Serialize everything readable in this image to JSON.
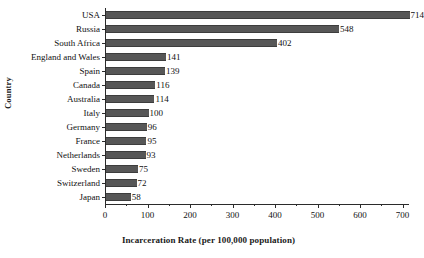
{
  "chart_data": {
    "type": "bar",
    "orientation": "horizontal",
    "title": "",
    "xlabel": "Incarceration Rate (per 100,000 population)",
    "ylabel": "Country",
    "categories": [
      "USA",
      "Russia",
      "South Africa",
      "England and Wales",
      "Spain",
      "Canada",
      "Australia",
      "Italy",
      "Germany",
      "France",
      "Netherlands",
      "Sweden",
      "Switzerland",
      "Japan"
    ],
    "values": [
      714,
      548,
      402,
      141,
      139,
      116,
      114,
      100,
      96,
      95,
      93,
      75,
      72,
      58
    ],
    "xlim": [
      0,
      715
    ],
    "xticks": [
      0,
      100,
      200,
      300,
      400,
      500,
      600,
      700
    ],
    "xtick_labels": [
      "0",
      "100",
      "200",
      "300",
      "400",
      "500",
      "600",
      "700"
    ],
    "minor_xticks": [
      50,
      150,
      250,
      350,
      450,
      550,
      650
    ],
    "grid": false,
    "legend": false,
    "bar_color": "#575757",
    "axis_color": "#2b2b2b",
    "background": "#ffffff",
    "data_labels": [
      "714",
      "548",
      "402",
      "141",
      "139",
      "116",
      "114",
      "100",
      "96",
      "95",
      "93",
      "75",
      "72",
      "58"
    ]
  }
}
